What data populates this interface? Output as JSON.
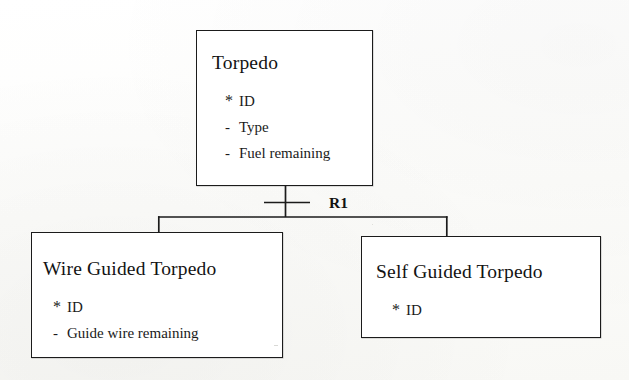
{
  "diagram": {
    "type": "subtype-supertype-relationship-diagram",
    "notation": "information-model",
    "relationship_label": "R1",
    "supertype": {
      "name": "Torpedo",
      "attributes": [
        {
          "marker": "*",
          "name": "ID"
        },
        {
          "marker": "-",
          "name": "Type"
        },
        {
          "marker": "-",
          "name": "Fuel remaining"
        }
      ]
    },
    "subtypes": [
      {
        "name": "Wire Guided Torpedo",
        "attributes": [
          {
            "marker": "*",
            "name": "ID"
          },
          {
            "marker": "-",
            "name": "Guide wire remaining"
          }
        ]
      },
      {
        "name": "Self Guided Torpedo",
        "attributes": [
          {
            "marker": "*",
            "name": "ID"
          }
        ]
      }
    ]
  },
  "style": {
    "line_color": "#1b1b1b",
    "text_color": "#161616",
    "box_fill": "#ffffff",
    "page_background": "#fdfdfc"
  }
}
